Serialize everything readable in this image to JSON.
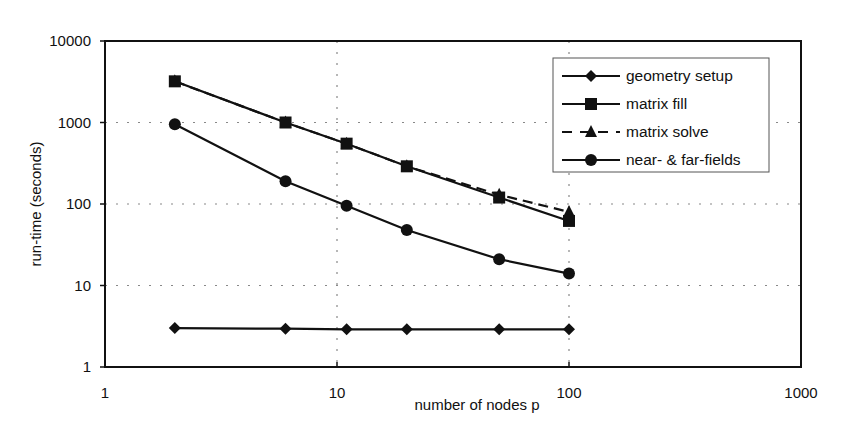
{
  "chart_data": {
    "type": "line",
    "title": "",
    "xlabel": "number of nodes p",
    "ylabel": "run-time (seconds)",
    "xscale": "log",
    "yscale": "log",
    "xlim": [
      1,
      1000
    ],
    "ylim": [
      1,
      10000
    ],
    "x_ticks": [
      "1",
      "10",
      "100",
      "1000"
    ],
    "y_ticks": [
      "1",
      "10",
      "100",
      "1000",
      "10000"
    ],
    "grid": "dotted major gridlines at 10, 100 on x and 10, 100, 1000 on y",
    "legend_position": "top-right inside plot",
    "x": [
      2,
      6,
      11,
      20,
      50,
      100
    ],
    "series": [
      {
        "name": "geometry setup",
        "marker": "diamond",
        "line": "solid",
        "values": [
          3,
          2.95,
          2.9,
          2.9,
          2.9,
          2.9
        ]
      },
      {
        "name": "matrix fill",
        "marker": "square",
        "line": "solid",
        "values": [
          3200,
          1000,
          550,
          290,
          120,
          62
        ]
      },
      {
        "name": "matrix solve",
        "marker": "triangle",
        "line": "dashed",
        "values": [
          3200,
          1000,
          550,
          290,
          130,
          80
        ]
      },
      {
        "name": "near- & far-fields",
        "marker": "circle",
        "line": "solid",
        "values": [
          950,
          190,
          95,
          48,
          21,
          14
        ]
      }
    ]
  },
  "colors": {
    "line": "#111111",
    "grid": "#888888",
    "background": "#ffffff"
  }
}
